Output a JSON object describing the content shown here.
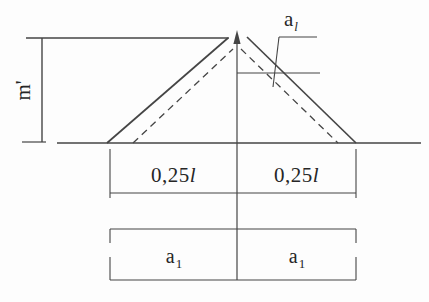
{
  "figure": {
    "background": "#fdfdfd",
    "line_color": "#454545",
    "text_color": "#262626",
    "labels": {
      "moment_ordinate": "m'",
      "shift": {
        "base": "a",
        "sub": "l"
      },
      "span_left": {
        "num": "0,25",
        "unit": "l"
      },
      "span_right": {
        "num": "0,25",
        "unit": "l"
      },
      "bar_left": {
        "base": "a",
        "sub": "1"
      },
      "bar_right": {
        "base": "a",
        "sub": "1"
      }
    }
  }
}
